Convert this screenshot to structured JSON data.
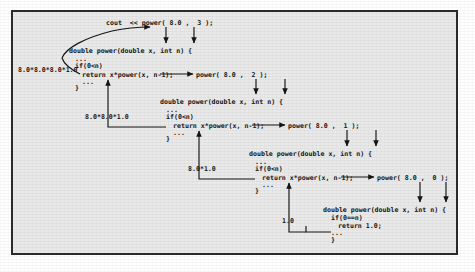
{
  "figure": {
    "background_color": "#e9e9e9",
    "border_color": "#2b2b2b",
    "text_color": "#141414",
    "width": 475,
    "height": 272
  },
  "call_site": {
    "text": "cout  << power( 8.0 ,  3 );"
  },
  "frames": [
    {
      "id": "frame-n3",
      "signature": "double power(double x, int n) {",
      "ellipsis_top": "...",
      "condition": "if(0<n)",
      "return_statement": "return x*power(x, n-1);",
      "ellipsis_bottom": "...",
      "close_brace": "}",
      "next_call": "power( 8.0 ,  2 );",
      "returned_value": "8.0*8.0*8.0*1.0"
    },
    {
      "id": "frame-n2",
      "signature": "double power(double x, int n) {",
      "ellipsis_top": "...",
      "condition": "if(0<n)",
      "return_statement": "return x*power(x, n-1);",
      "ellipsis_bottom": "...",
      "close_brace": "}",
      "next_call": "power( 8.0 ,  1 );",
      "returned_value": "8.0*8.0*1.0"
    },
    {
      "id": "frame-n1",
      "signature": "double power(double x, int n) {",
      "ellipsis_top": "...",
      "condition": "if(0<n)",
      "return_statement": "return x*power(x, n-1);",
      "ellipsis_bottom": "...",
      "close_brace": "}",
      "next_call": "power( 8.0 ,  0 );",
      "returned_value": "8.0*1.0"
    },
    {
      "id": "frame-n0",
      "signature": "double power(double x, int n) {",
      "condition": "if(0==n)",
      "return_statement": "return 1.0;",
      "ellipsis_bottom": "...",
      "close_brace": "}",
      "returned_value": "1.0"
    }
  ]
}
